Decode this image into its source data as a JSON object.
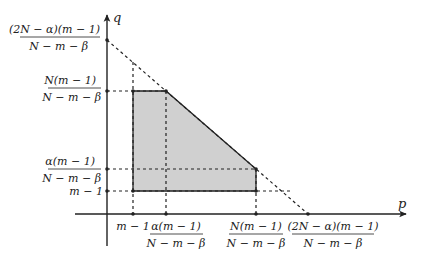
{
  "diagram": {
    "type": "feasible-region-plot",
    "axes": {
      "x_label": "p",
      "y_label": "q"
    },
    "y_ticks": [
      {
        "id": "y_top",
        "num": "(2N − α)(m − 1)",
        "den": "N − m − β"
      },
      {
        "id": "y_N",
        "num": "N(m − 1)",
        "den": "N − m − β"
      },
      {
        "id": "y_alpha",
        "num": "α(m − 1)",
        "den": "N − m − β"
      },
      {
        "id": "y_m",
        "plain": "m − 1"
      }
    ],
    "x_ticks": [
      {
        "id": "x_m",
        "plain": "m − 1"
      },
      {
        "id": "x_alpha",
        "num": "α(m − 1)",
        "den": "N − m − β"
      },
      {
        "id": "x_N",
        "num": "N(m − 1)",
        "den": "N − m − β"
      },
      {
        "id": "x_top",
        "num": "(2N − α)(m − 1)",
        "den": "N − m − β"
      }
    ],
    "region": {
      "description": "shaded pentagon",
      "vertices": [
        [
          "m − 1",
          "N(m − 1)/(N − m − β)"
        ],
        [
          "α(m − 1)/(N − m − β)",
          "N(m − 1)/(N − m − β)"
        ],
        [
          "N(m − 1)/(N − m − β)",
          "α(m − 1)/(N − m − β)"
        ],
        [
          "N(m − 1)/(N − m − β)",
          "m − 1"
        ],
        [
          "m − 1",
          "m − 1"
        ]
      ],
      "fill_color": "#d0d0d0"
    },
    "budget_line": {
      "from": [
        "0",
        "(2N − α)(m − 1)/(N − m − β)"
      ],
      "to": [
        "(2N − α)(m − 1)/(N − m − β)",
        "0"
      ],
      "style": "dashed"
    }
  }
}
